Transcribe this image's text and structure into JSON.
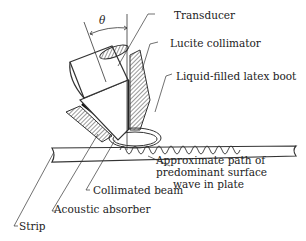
{
  "figure": {
    "angle_symbol": "θ",
    "labels": {
      "transducer": "Transducer",
      "lucite_collimator": "Lucite collimator",
      "latex_boot": "Liquid-filled latex boot",
      "surface_wave_line1": "Approximate path of",
      "surface_wave_line2": "predominant surface",
      "surface_wave_line3": "wave in plate",
      "collimated_beam": "Collimated beam",
      "acoustic_absorber": "Acoustic absorber",
      "strip": "Strip"
    }
  }
}
